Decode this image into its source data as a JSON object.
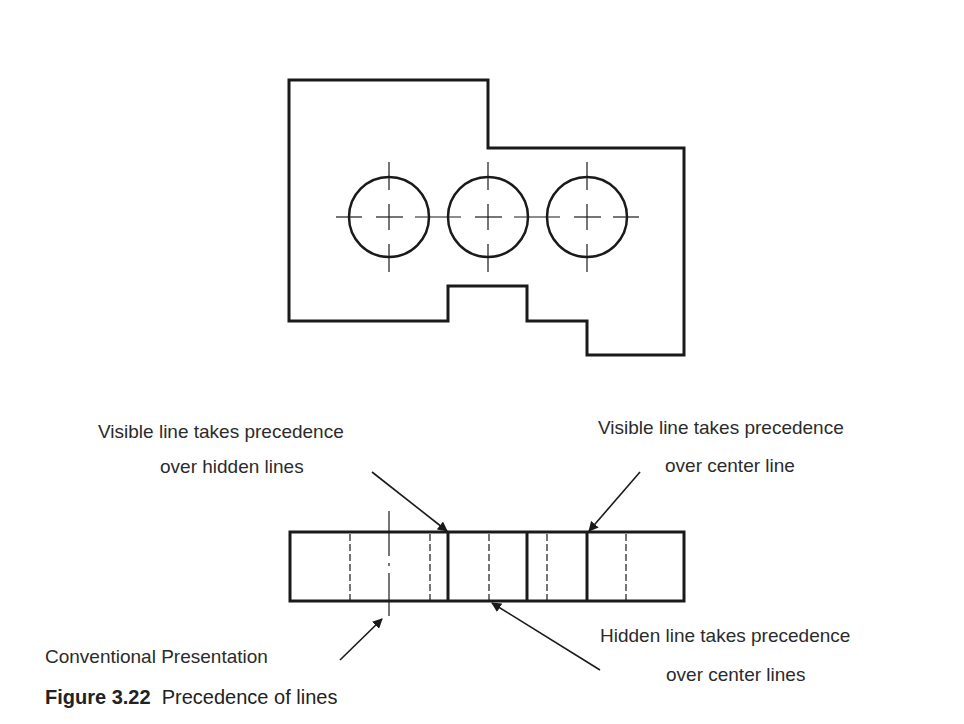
{
  "figure": {
    "number": "Figure 3.22",
    "title": "Precedence of lines"
  },
  "annotations": {
    "visible_over_hidden": [
      "Visible line takes precedence",
      "over hidden lines"
    ],
    "visible_over_center": [
      "Visible line takes precedence",
      "over center line"
    ],
    "hidden_over_center": [
      "Hidden line takes precedence",
      "over center lines"
    ],
    "conventional": "Conventional Presentation"
  },
  "colors": {
    "line": "#1a1a1a",
    "text": "#2b2b2b",
    "background": "#ffffff"
  },
  "top_view": {
    "outline_points": [
      [
        289,
        80
      ],
      [
        488,
        80
      ],
      [
        488,
        148
      ],
      [
        684,
        148
      ],
      [
        684,
        355
      ],
      [
        587,
        355
      ],
      [
        587,
        321
      ],
      [
        527,
        321
      ],
      [
        527,
        286
      ],
      [
        448,
        286
      ],
      [
        448,
        321
      ],
      [
        289,
        321
      ]
    ],
    "holes": [
      {
        "cx": 389,
        "cy": 217,
        "r": 40
      },
      {
        "cx": 488,
        "cy": 217,
        "r": 40
      },
      {
        "cx": 587,
        "cy": 217,
        "r": 40
      }
    ]
  },
  "front_view": {
    "rect": {
      "x": 290,
      "y": 532,
      "w": 394,
      "h": 69
    },
    "solid_lines_x": [
      448,
      527,
      587
    ],
    "hidden_lines_x": [
      350,
      430,
      489,
      547,
      626
    ],
    "center_line_x": 389
  }
}
